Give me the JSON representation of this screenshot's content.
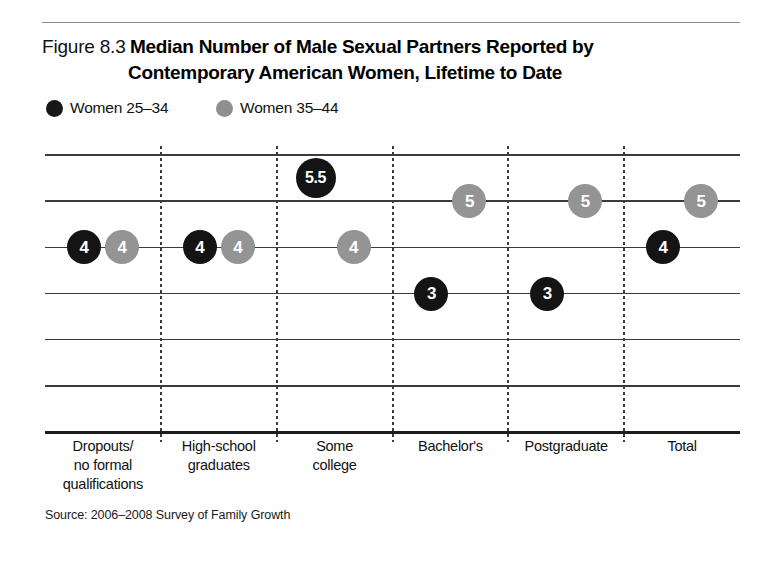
{
  "figure": {
    "number": "Figure 8.3",
    "title_line_1": "Median Number of Male Sexual Partners Reported by",
    "title_line_2": "Contemporary American Women, Lifetime to Date",
    "source": "Source: 2006–2008 Survey of Family Growth"
  },
  "legend": [
    {
      "label": "Women 25–34",
      "color": "#171717",
      "series_key": "women_25_34"
    },
    {
      "label": "Women 35–44",
      "color": "#8f8f8f",
      "series_key": "women_35_44"
    }
  ],
  "chart_data": {
    "type": "scatter",
    "title": "Median Number of Male Sexual Partners Reported by Contemporary American Women, Lifetime to Date",
    "subtitle": "",
    "xlabel": "",
    "ylabel": "",
    "categories": [
      "Dropouts/\nno formal\nqualifications",
      "High-school\ngraduates",
      "Some\ncollege",
      "Bachelor's",
      "Postgraduate",
      "Total"
    ],
    "series": [
      {
        "name": "Women 25–34",
        "color": "#141414",
        "values": [
          4,
          4,
          5.5,
          3,
          3,
          4
        ]
      },
      {
        "name": "Women 35–44",
        "color": "#949494",
        "values": [
          4,
          4,
          4,
          5,
          5,
          5
        ]
      }
    ],
    "ylim": [
      0,
      7
    ],
    "grid": true,
    "gridlines_y": [
      6,
      5,
      4,
      3,
      2,
      1,
      0
    ],
    "legend_position": "top-left",
    "annotations": [],
    "source": "Source: 2006–2008 Survey of Family Growth"
  },
  "category_labels": [
    [
      "Dropouts/",
      "no formal",
      "qualifications"
    ],
    [
      "High-school",
      "graduates"
    ],
    [
      "Some",
      "college"
    ],
    [
      "Bachelor's"
    ],
    [
      "Postgraduate"
    ],
    [
      "Total"
    ]
  ]
}
